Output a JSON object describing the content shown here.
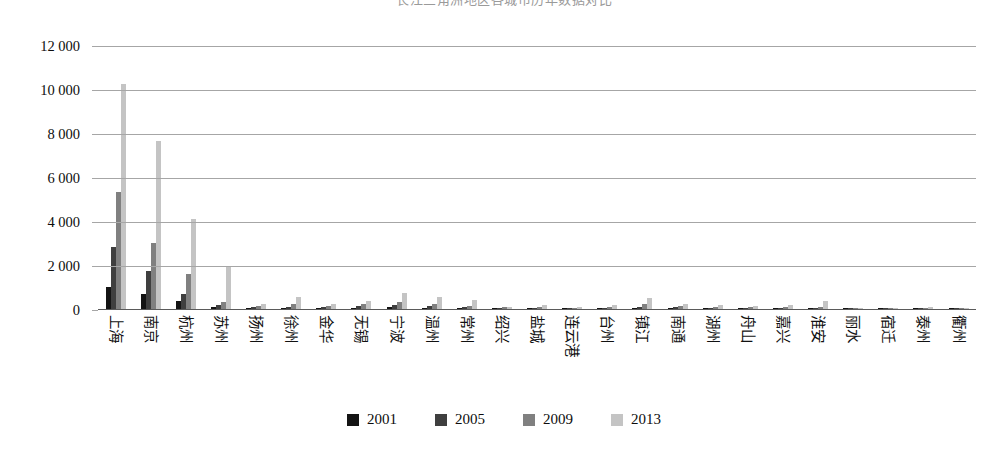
{
  "chart_data": {
    "type": "bar",
    "title": "长江三角洲地区各城市历年数据对比",
    "subtitle": "",
    "xlabel": "",
    "ylabel": "",
    "ylim": [
      0,
      12000
    ],
    "ytick_step": 2000,
    "ytick_labels": [
      "0",
      "2 000",
      "4 000",
      "6 000",
      "8 000",
      "10 000",
      "12 000"
    ],
    "ytick_values": [
      0,
      2000,
      4000,
      6000,
      8000,
      10000,
      12000
    ],
    "grid": true,
    "legend_position": "bottom",
    "categories": [
      "上海",
      "南京",
      "杭州",
      "苏州",
      "扬州",
      "徐州",
      "金华",
      "无锡",
      "宁波",
      "温州",
      "常州",
      "绍兴",
      "盐城",
      "连云港",
      "台州",
      "镇江",
      "南通",
      "湖州",
      "舟山",
      "嘉兴",
      "淮安",
      "丽水",
      "宿迁",
      "泰州",
      "衢州"
    ],
    "series": [
      {
        "name": "2001",
        "color": "#141414",
        "values": [
          1000,
          700,
          350,
          90,
          30,
          40,
          25,
          60,
          90,
          60,
          40,
          20,
          25,
          15,
          30,
          50,
          35,
          20,
          20,
          25,
          15,
          10,
          10,
          15,
          10
        ]
      },
      {
        "name": "2005",
        "color": "#3f3f3f",
        "values": [
          2800,
          1750,
          700,
          200,
          70,
          100,
          70,
          130,
          190,
          130,
          80,
          40,
          50,
          35,
          60,
          110,
          75,
          45,
          40,
          55,
          35,
          20,
          20,
          30,
          20
        ]
      },
      {
        "name": "2009",
        "color": "#808080",
        "values": [
          5300,
          3000,
          1600,
          330,
          140,
          220,
          150,
          250,
          330,
          250,
          140,
          70,
          100,
          60,
          110,
          230,
          140,
          90,
          80,
          110,
          70,
          35,
          35,
          55,
          35
        ]
      },
      {
        "name": "2013",
        "color": "#c4c4c4",
        "values": [
          10250,
          7650,
          4100,
          1950,
          230,
          560,
          250,
          370,
          750,
          540,
          390,
          110,
          170,
          110,
          190,
          500,
          210,
          170,
          130,
          190,
          360,
          60,
          60,
          90,
          55
        ]
      }
    ]
  },
  "legend": {
    "items": [
      {
        "label": "2001",
        "color": "#141414"
      },
      {
        "label": "2005",
        "color": "#3f3f3f"
      },
      {
        "label": "2009",
        "color": "#808080"
      },
      {
        "label": "2013",
        "color": "#c4c4c4"
      }
    ]
  }
}
